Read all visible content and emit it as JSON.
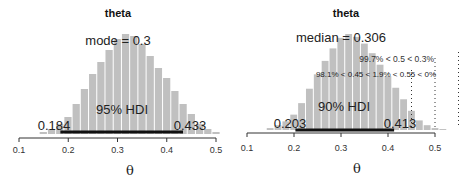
{
  "chart_data": [
    {
      "type": "bar",
      "title": "theta",
      "xlabel": "θ",
      "ylabel": "",
      "xlim": [
        0.1,
        0.5
      ],
      "xticks": [
        "0.1",
        "0.2",
        "0.3",
        "0.4",
        "0.5"
      ],
      "xtick_values": [
        0.1,
        0.2,
        0.3,
        0.4,
        0.5
      ],
      "central_tendency_label": "mode = 0.3",
      "hdi": {
        "label": "95% HDI",
        "low": 0.184,
        "high": 0.433,
        "low_label": "0.184",
        "high_label": "0.433"
      },
      "bin_width": 0.0167,
      "bins_start": 0.142,
      "relative_density": [
        0.02,
        0.05,
        0.1,
        0.17,
        0.3,
        0.45,
        0.6,
        0.72,
        0.84,
        0.95,
        1.0,
        0.98,
        0.9,
        0.78,
        0.66,
        0.56,
        0.43,
        0.3,
        0.2,
        0.1,
        0.05,
        0.02
      ],
      "bar_color": "#c0c0c0"
    },
    {
      "type": "bar",
      "title": "theta",
      "xlabel": "θ",
      "ylabel": "",
      "xlim": [
        0.1,
        0.5
      ],
      "xticks": [
        "0.1",
        "0.2",
        "0.3",
        "0.4",
        "0.5"
      ],
      "xtick_values": [
        0.1,
        0.2,
        0.3,
        0.4,
        0.5
      ],
      "central_tendency_label": "median = 0.306",
      "hdi": {
        "label": "90% HDI",
        "low": 0.203,
        "high": 0.413,
        "low_label": "0.203",
        "high_label": "0.413"
      },
      "comparison_lines": [
        {
          "value": 0.45,
          "style": "dotted"
        },
        {
          "value": 0.5,
          "style": "dotted"
        },
        {
          "value": 0.55,
          "style": "dotted"
        }
      ],
      "annotations": [
        "99.7% < 0.5 < 0.3%",
        "98.1% < 0.45 < 1.9% < 0.55 < 0%"
      ],
      "bin_width": 0.0167,
      "bins_start": 0.142,
      "relative_density": [
        0.02,
        0.05,
        0.09,
        0.16,
        0.28,
        0.43,
        0.58,
        0.72,
        0.85,
        0.96,
        1.0,
        0.97,
        0.9,
        0.8,
        0.68,
        0.56,
        0.44,
        0.32,
        0.2,
        0.1,
        0.05,
        0.02,
        0.01
      ],
      "bar_color": "#c0c0c0"
    }
  ]
}
